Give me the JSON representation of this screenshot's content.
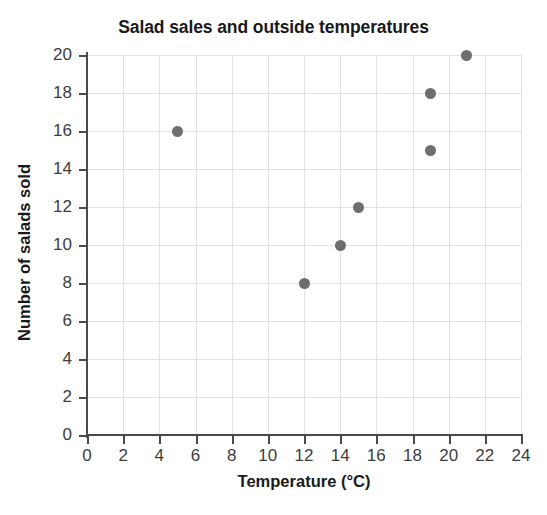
{
  "figure": {
    "clipped_text_above": "",
    "background_color": "#ffffff"
  },
  "chart_data": {
    "type": "scatter",
    "title": "Salad sales and outside temperatures",
    "xlabel": "Temperature (°C)",
    "ylabel": "Number of salads sold",
    "xlim": [
      0,
      24
    ],
    "ylim": [
      0,
      20
    ],
    "xticks": [
      0,
      2,
      4,
      6,
      8,
      10,
      12,
      14,
      16,
      18,
      20,
      22,
      24
    ],
    "yticks": [
      0,
      2,
      4,
      6,
      8,
      10,
      12,
      14,
      16,
      18,
      20
    ],
    "xtick_labels": [
      "0",
      "2",
      "4",
      "6",
      "8",
      "10",
      "12",
      "14",
      "16",
      "18",
      "20",
      "22",
      "24"
    ],
    "ytick_labels": [
      "0",
      "2",
      "4",
      "6",
      "8",
      "10",
      "12",
      "14",
      "16",
      "18",
      "20"
    ],
    "grid": true,
    "legend": null,
    "marker_color": "#6e6e6e",
    "grid_color": "#e2e2e2",
    "axis_color": "#4a4a4a",
    "points": [
      {
        "x": 5,
        "y": 16
      },
      {
        "x": 12,
        "y": 8
      },
      {
        "x": 14,
        "y": 10
      },
      {
        "x": 15,
        "y": 12
      },
      {
        "x": 19,
        "y": 15
      },
      {
        "x": 19,
        "y": 18
      },
      {
        "x": 21,
        "y": 20
      }
    ]
  }
}
